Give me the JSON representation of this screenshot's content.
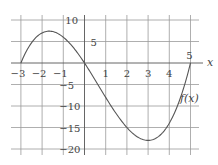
{
  "chart_data": {
    "type": "line",
    "title": "",
    "xlabel": "x",
    "ylabel": "",
    "xlim": [
      -3.8,
      5.8
    ],
    "ylim": [
      -21,
      12
    ],
    "grid": true,
    "x_ticks": [
      -3,
      -2,
      -1,
      1,
      2,
      3,
      4,
      5
    ],
    "x_tick_labels": [
      "−3",
      "−2",
      "−1",
      "1",
      "2",
      "3",
      "4",
      "5"
    ],
    "y_ticks": [
      10,
      5,
      -5,
      -10,
      -15,
      -20
    ],
    "y_tick_labels": [
      "10",
      "5",
      "−5",
      "−10",
      "−15",
      "−20"
    ],
    "series": [
      {
        "name": "f(x)",
        "label": "f(x)",
        "formula": "0.5*(x+3)*x*(x-5)",
        "x": [
          -3,
          -2.5,
          -2,
          -1.5,
          -1,
          -0.5,
          0,
          0.5,
          1,
          1.5,
          2,
          2.5,
          3,
          3.5,
          4,
          4.5,
          5
        ],
        "y": [
          0,
          5.6,
          7.0,
          5.6,
          2.0,
          -3.1,
          0.0,
          -4.8,
          -8.0,
          -12.0,
          -15.0,
          -17.2,
          -18.0,
          -17.1,
          -14.0,
          -8.4,
          0
        ]
      }
    ]
  }
}
